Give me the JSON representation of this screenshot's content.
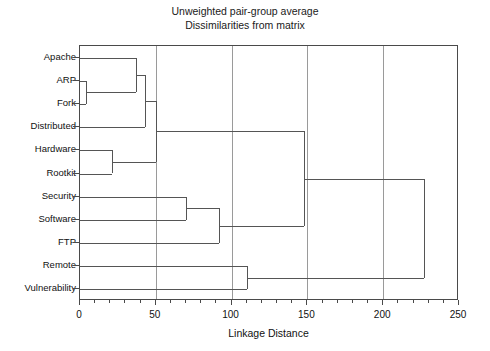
{
  "chart_data": {
    "type": "dendrogram",
    "title": "Unweighted pair-group average",
    "subtitle": "Dissimilarities from matrix",
    "xlabel": "Linkage Distance",
    "ylabel": "",
    "xlim": [
      0,
      250
    ],
    "xticks": [
      0,
      50,
      100,
      150,
      200,
      250
    ],
    "xticklabels": [
      "0",
      "50",
      "100",
      "150",
      "200",
      "250"
    ],
    "grid": "vertical",
    "leaves": [
      "Apache",
      "ARP",
      "Fork",
      "Distributed",
      "Hardware",
      "Rootkit",
      "Security",
      "Software",
      "FTP",
      "Remote",
      "Vulnerability"
    ],
    "merges": [
      {
        "id": "m1",
        "label": "ARP + Fork",
        "members": [
          "ARP",
          "Fork"
        ],
        "distance": 4
      },
      {
        "id": "m2",
        "label": "Hardware + Rootkit",
        "members": [
          "Hardware",
          "Rootkit"
        ],
        "distance": 21
      },
      {
        "id": "m3",
        "label": "(ARP,Fork) + Apache",
        "members": [
          "Apache",
          "ARP",
          "Fork"
        ],
        "distance": 37
      },
      {
        "id": "m4",
        "label": "(Apache,ARP,Fork) + Distributed",
        "members": [
          "Apache",
          "ARP",
          "Fork",
          "Distributed"
        ],
        "distance": 43
      },
      {
        "id": "m5",
        "label": "upper group + (Hardware,Rootkit)",
        "members": [
          "Apache",
          "ARP",
          "Fork",
          "Distributed",
          "Hardware",
          "Rootkit"
        ],
        "distance": 50
      },
      {
        "id": "m6",
        "label": "Security + Software",
        "members": [
          "Security",
          "Software"
        ],
        "distance": 70
      },
      {
        "id": "m7",
        "label": "(Security,Software) + FTP",
        "members": [
          "Security",
          "Software",
          "FTP"
        ],
        "distance": 92
      },
      {
        "id": "m8",
        "label": "Remote + Vulnerability",
        "members": [
          "Remote",
          "Vulnerability"
        ],
        "distance": 110
      },
      {
        "id": "m9",
        "label": "upper cluster + (Security,Software,FTP)",
        "members": [
          "Apache",
          "ARP",
          "Fork",
          "Distributed",
          "Hardware",
          "Rootkit",
          "Security",
          "Software",
          "FTP"
        ],
        "distance": 148
      },
      {
        "id": "m10",
        "label": "root",
        "members": [
          "all"
        ],
        "distance": 227
      }
    ],
    "colors": {
      "line": "#555555",
      "grid": "#9a9a9a",
      "frame": "#4a4a4a",
      "background": "#ffffff",
      "text": "#111111"
    }
  }
}
